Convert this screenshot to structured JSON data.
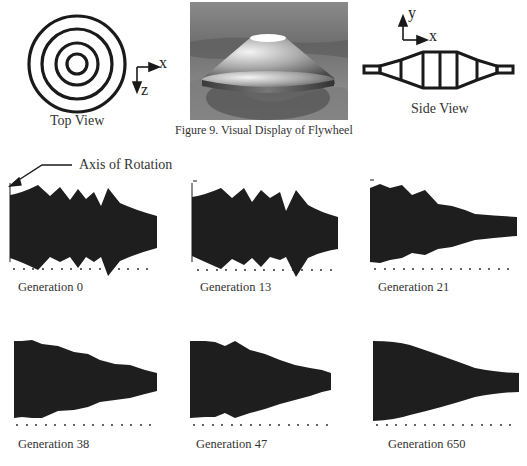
{
  "figure": {
    "caption": "Figure 9. Visual Display of Flywheel",
    "top_view_label": "Top View",
    "side_view_label": "Side View",
    "top_axes": {
      "x": "x",
      "z": "z"
    },
    "side_axes": {
      "x": "x",
      "y": "y"
    }
  },
  "annotation": {
    "axis_of_rotation": "Axis of Rotation"
  },
  "generations": [
    {
      "label": "Generation 0"
    },
    {
      "label": "Generation 13"
    },
    {
      "label": "Generation 21"
    },
    {
      "label": "Generation 38"
    },
    {
      "label": "Generation 47"
    },
    {
      "label": "Generation 650"
    }
  ],
  "colors": {
    "ink": "#1a1a1a",
    "profile_fill": "#1e1e1e",
    "text": "#333333"
  }
}
